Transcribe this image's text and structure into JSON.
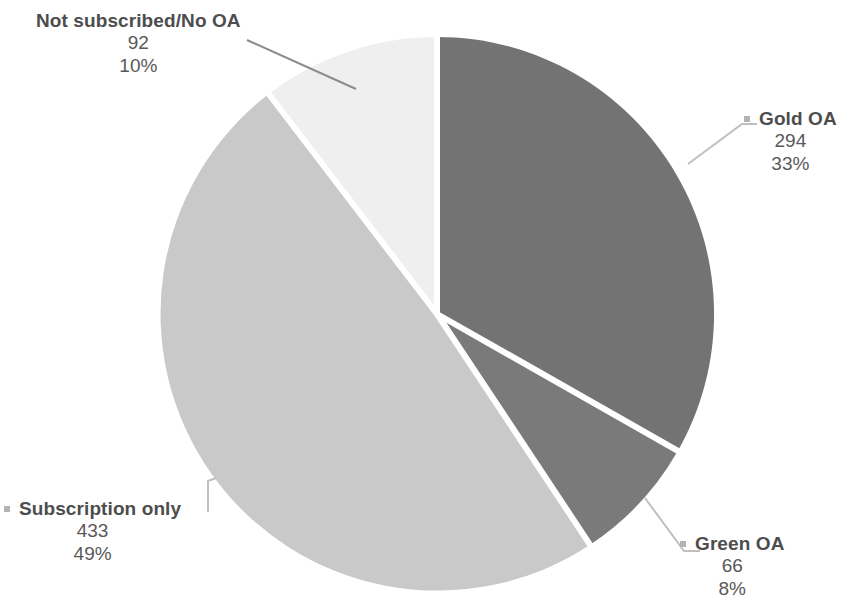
{
  "chart_data": {
    "type": "pie",
    "title": "",
    "subtitle": "",
    "xlabel": "",
    "ylabel": "",
    "legend_position": "none",
    "grid": false,
    "total": 885,
    "categories": [
      "Gold OA",
      "Green OA",
      "Subscription only",
      "Not subscribed/No OA"
    ],
    "values": [
      294,
      66,
      433,
      92
    ],
    "percent_labels": [
      "33%",
      "8%",
      "49%",
      "10%"
    ],
    "value_labels": [
      "294",
      "66",
      "433",
      "92"
    ],
    "colors": [
      "#737373",
      "#7a7a7a",
      "#c9c9c9",
      "#efefef"
    ],
    "slices": [
      {
        "name": "Gold OA",
        "value": 294,
        "value_label": "294",
        "percent_label": "33%",
        "color": "#737373",
        "start_angle": 0,
        "end_angle": 119.6,
        "marker": "square-marker"
      },
      {
        "name": "Green OA",
        "value": 66,
        "value_label": "66",
        "percent_label": "8%",
        "color": "#7a7a7a",
        "start_angle": 119.6,
        "end_angle": 146.4,
        "marker": "square-marker"
      },
      {
        "name": "Subscription only",
        "value": 433,
        "value_label": "433",
        "percent_label": "49%",
        "color": "#c9c9c9",
        "start_angle": 146.4,
        "end_angle": 322.5,
        "marker": "square-marker"
      },
      {
        "name": "Not subscribed/No OA",
        "value": 92,
        "value_label": "92",
        "percent_label": "10%",
        "color": "#efefef",
        "start_angle": 322.5,
        "end_angle": 360,
        "marker": "square-marker"
      }
    ]
  },
  "labels": {
    "not_subscribed": {
      "name": "Not subscribed/No OA",
      "value": "92",
      "percent": "10%"
    },
    "gold_oa": {
      "name": "Gold OA",
      "value": "294",
      "percent": "33%"
    },
    "green_oa": {
      "name": "Green OA",
      "value": "66",
      "percent": "8%"
    },
    "subscription_only": {
      "name": "Subscription only",
      "value": "433",
      "percent": "49%"
    }
  },
  "style": {
    "slice_gap_color": "#ffffff",
    "leader_line_color": "#bfbfbf",
    "text_color": "#595959",
    "heading_color": "#4d4d4d",
    "marker_color": "#b3b3b3",
    "background": "#ffffff"
  }
}
